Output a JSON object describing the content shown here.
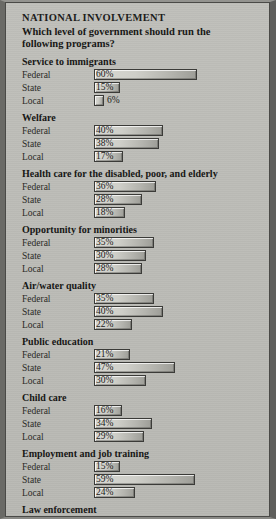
{
  "panel": {
    "title": "NATIONAL INVOLVEMENT",
    "subtitle": "Which level of government should run the following programs?",
    "background_color": "#bcbcb7",
    "frame_color": "#4a4a47",
    "bar_fill_color": "#cfcfc9",
    "bar_outline_color": "#3b3b38",
    "text_color": "#1b1b19"
  },
  "chart_data": {
    "type": "bar",
    "orientation": "horizontal",
    "title": "NATIONAL INVOLVEMENT",
    "subtitle": "Which level of government should run the following programs?",
    "xlabel": "",
    "ylabel": "",
    "xlim": [
      0,
      60
    ],
    "grid": false,
    "legend": false,
    "value_suffix": "%",
    "categories": [
      "Federal",
      "State",
      "Local"
    ],
    "groups": [
      {
        "name": "Service to immigrants",
        "rows": [
          {
            "label": "Federal",
            "value": 60,
            "display": "60%"
          },
          {
            "label": "State",
            "value": 15,
            "display": "15%"
          },
          {
            "label": "Local",
            "value": 6,
            "display": "6%"
          }
        ]
      },
      {
        "name": "Welfare",
        "rows": [
          {
            "label": "Federal",
            "value": 40,
            "display": "40%"
          },
          {
            "label": "State",
            "value": 38,
            "display": "38%"
          },
          {
            "label": "Local",
            "value": 17,
            "display": "17%"
          }
        ]
      },
      {
        "name": "Health care for the disabled, poor, and elderly",
        "rows": [
          {
            "label": "Federal",
            "value": 36,
            "display": "36%"
          },
          {
            "label": "State",
            "value": 28,
            "display": "28%"
          },
          {
            "label": "Local",
            "value": 18,
            "display": "18%"
          }
        ]
      },
      {
        "name": "Opportunity for minorities",
        "rows": [
          {
            "label": "Federal",
            "value": 35,
            "display": "35%"
          },
          {
            "label": "State",
            "value": 30,
            "display": "30%"
          },
          {
            "label": "Local",
            "value": 28,
            "display": "28%"
          }
        ]
      },
      {
        "name": "Air/water quality",
        "rows": [
          {
            "label": "Federal",
            "value": 35,
            "display": "35%"
          },
          {
            "label": "State",
            "value": 40,
            "display": "40%"
          },
          {
            "label": "Local",
            "value": 22,
            "display": "22%"
          }
        ]
      },
      {
        "name": "Public education",
        "rows": [
          {
            "label": "Federal",
            "value": 21,
            "display": "21%"
          },
          {
            "label": "State",
            "value": 47,
            "display": "47%"
          },
          {
            "label": "Local",
            "value": 30,
            "display": "30%"
          }
        ]
      },
      {
        "name": "Child care",
        "rows": [
          {
            "label": "Federal",
            "value": 16,
            "display": "16%"
          },
          {
            "label": "State",
            "value": 34,
            "display": "34%"
          },
          {
            "label": "Local",
            "value": 29,
            "display": "29%"
          }
        ]
      },
      {
        "name": "Employment and job training",
        "rows": [
          {
            "label": "Federal",
            "value": 15,
            "display": "15%"
          },
          {
            "label": "State",
            "value": 59,
            "display": "59%"
          },
          {
            "label": "Local",
            "value": 24,
            "display": "24%"
          }
        ]
      },
      {
        "name": "Law enforcement",
        "rows": [
          {
            "label": "Federal",
            "value": 15,
            "display": "15%"
          },
          {
            "label": "State",
            "value": 36,
            "display": "36%"
          },
          {
            "label": "Local",
            "value": 45,
            "display": "45%"
          }
        ]
      }
    ]
  }
}
